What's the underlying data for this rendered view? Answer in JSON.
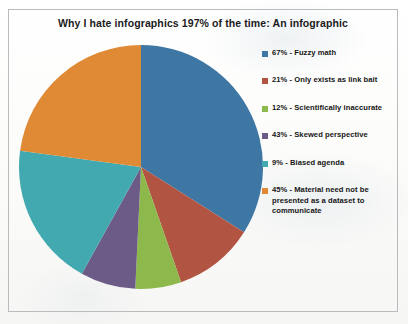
{
  "document": {
    "background_color": "#fdfdfb",
    "border_color": "#b9bcbe"
  },
  "chart_data": {
    "type": "pie",
    "title": "Why I hate infographics 197% of the time: An infographic",
    "xlabel": "",
    "ylabel": "",
    "legend_position": "right",
    "grid": false,
    "total_labeled_percent": 197,
    "categories": [
      "Fuzzy math",
      "Only exists as link bait",
      "Scientifically inaccurate",
      "Skewed perspective",
      "Biased agenda",
      "Material need not be presented as a dataset to communicate"
    ],
    "values": [
      67,
      21,
      12,
      43,
      9,
      45
    ],
    "normalized_percent": [
      34.0,
      10.7,
      6.1,
      21.8,
      4.6,
      22.8
    ],
    "colors": [
      "#3f77a4",
      "#b15542",
      "#8db94c",
      "#6b5b86",
      "#43a9b0",
      "#e08a36"
    ],
    "slices": [
      {
        "label": "Fuzzy math",
        "value": 67,
        "percent_label": "67%",
        "color": "#3f77a4",
        "start_angle": 0,
        "sweep_angle": 122.4
      },
      {
        "label": "Only exists as link bait",
        "value": 21,
        "percent_label": "21%",
        "color": "#b15542",
        "start_angle": 122.4,
        "sweep_angle": 38.4
      },
      {
        "label": "Scientifically inaccurate",
        "value": 12,
        "percent_label": "12%",
        "color": "#8db94c",
        "start_angle": 160.8,
        "sweep_angle": 21.9
      },
      {
        "label": "Skewed perspective",
        "value": 43,
        "percent_label": "43%",
        "color": "#6b5b86",
        "start_angle": 182.7,
        "sweep_angle": 26.3
      },
      {
        "label": "Biased agenda",
        "value": 9,
        "percent_label": "9%",
        "color": "#43a9b0",
        "start_angle": 209.0,
        "sweep_angle": 68.6
      },
      {
        "label": "Material need not be presented as a dataset to communicate",
        "value": 45,
        "percent_label": "45%",
        "color": "#e08a36",
        "start_angle": 277.6,
        "sweep_angle": 82.4
      }
    ],
    "geometry": {
      "center_x": 125,
      "center_y": 124,
      "radius": 122
    }
  },
  "legend": {
    "items": [
      {
        "swatch_color": "#3f77a4",
        "text": "67% - Fuzzy math"
      },
      {
        "swatch_color": "#b15542",
        "text": "21% - Only exists as link bait"
      },
      {
        "swatch_color": "#8db94c",
        "text": "12%  - Scientifically inaccurate"
      },
      {
        "swatch_color": "#6b5b86",
        "text": "43% - Skewed perspective"
      },
      {
        "swatch_color": "#43a9b0",
        "text": "9% - Biased agenda"
      },
      {
        "swatch_color": "#e08a36",
        "text": "45% - Material need not be presented as a dataset to communicate"
      }
    ]
  }
}
